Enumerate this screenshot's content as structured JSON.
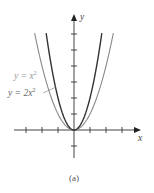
{
  "chart_data": {
    "type": "line",
    "title": "",
    "caption": "(a)",
    "xlabel": "x",
    "ylabel": "y",
    "xlim": [
      -3,
      4
    ],
    "ylim": [
      -1.7,
      7
    ],
    "grid": false,
    "x_ticks": [
      -3,
      -2,
      -1,
      1,
      2,
      3
    ],
    "y_ticks": [
      -1,
      1,
      2,
      3,
      4,
      5,
      6
    ],
    "tick_labels_shown": false,
    "series": [
      {
        "name": "y = x^2",
        "label": "y = x",
        "exponent_label": "2",
        "coef": 1,
        "color": "#8a8a8a",
        "width": 1.1
      },
      {
        "name": "y = 2x^2",
        "label": "y = 2x",
        "exponent_label": "2",
        "coef": 2,
        "color": "#333333",
        "width": 1.4
      }
    ],
    "annotations": [
      {
        "text": "y = x^2",
        "target_series": "y = x^2",
        "position": "upper-left"
      },
      {
        "text": "y = 2x^2",
        "target_series": "y = 2x^2",
        "position": "left",
        "leader_line": true
      }
    ]
  }
}
